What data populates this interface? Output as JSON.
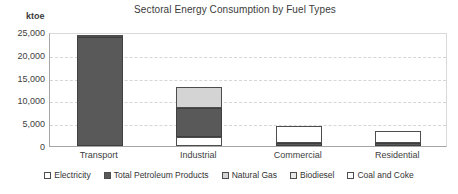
{
  "chart_data": {
    "type": "bar",
    "subtype": "stacked",
    "title": "Sectoral Energy Consumption by Fuel Types",
    "unit_label": "ktoe",
    "xlabel": "",
    "ylabel": "ktoe",
    "ylim": [
      0,
      25000
    ],
    "ytick_values": [
      25000,
      20000,
      15000,
      10000,
      5000,
      0
    ],
    "ytick_labels": [
      "25,000",
      "20,000",
      "15,000",
      "10,000",
      "5,000",
      "0"
    ],
    "grid": true,
    "grid_axis": "y",
    "legend_position": "bottom",
    "categories": [
      "Transport",
      "Industrial",
      "Commercial",
      "Residential"
    ],
    "series": [
      {
        "name": "Electricity",
        "color": "#ffffff",
        "values": [
          0,
          2000,
          0,
          0
        ]
      },
      {
        "name": "Total Petroleum Products",
        "color": "#595959",
        "values": [
          23900,
          6400,
          700,
          600
        ]
      },
      {
        "name": "Natural Gas",
        "color": "#d4d4d4",
        "values": [
          0,
          4600,
          0,
          0
        ]
      },
      {
        "name": "Biodiesel",
        "color": "#e8e8e8",
        "values": [
          0,
          0,
          0,
          0
        ]
      },
      {
        "name": "Coal and Coke",
        "color": "#ffffff",
        "values": [
          400,
          0,
          3800,
          2800
        ]
      }
    ],
    "totals": [
      24300,
      13000,
      4500,
      3400
    ]
  },
  "legend": {
    "items": [
      {
        "label": "Electricity",
        "swatch": "#ffffff"
      },
      {
        "label": "Total Petroleum Products",
        "swatch": "#595959"
      },
      {
        "label": "Natural Gas",
        "swatch": "#d4d4d4"
      },
      {
        "label": "Biodiesel",
        "swatch": "#e8e8e8"
      },
      {
        "label": "Coal and Coke",
        "swatch": "#ffffff"
      }
    ]
  },
  "colors": {
    "axis": "#a6a6a6",
    "gridline": "#d6d6d6",
    "text": "#3b3b3b",
    "plot_background": "#ffffff"
  }
}
